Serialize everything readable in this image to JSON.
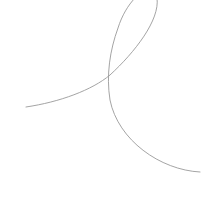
{
  "canvas": {
    "width": 203,
    "height": 197,
    "background": "#ffffff"
  },
  "curve": {
    "description": "single looping curve that crosses itself once",
    "stroke": "#9a9a9a",
    "stroke_width": 0.9,
    "start": [
      26,
      107
    ],
    "crossing": [
      110,
      75
    ],
    "loop_exits_top": [
      [
        157,
        0
      ],
      [
        141,
        0
      ]
    ],
    "end": [
      200,
      172
    ],
    "path": "M 26 107 C 60 102, 92 90, 110 75 C 135 52, 160 20, 157 -2 C 154 -22, 128 -4, 118 28 C 110 50, 106 75, 110 100 C 118 140, 160 170, 200 172"
  }
}
